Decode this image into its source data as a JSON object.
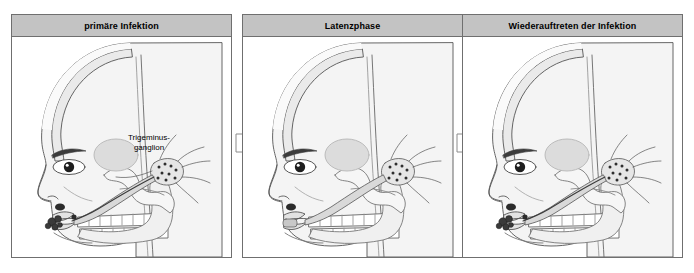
{
  "figure": {
    "background_color": "#ffffff",
    "header_fill": "#c3c3c3",
    "border_color": "#6f6f6f",
    "skin_fill": "#f2f2f2",
    "nerve_fill": "#d8d8d8",
    "lesion_color": "#3a3a3a",
    "line_color": "#4a4a4a"
  },
  "panels": [
    {
      "id": "panel-1",
      "title": "primäre Infektion",
      "label_line_1": "Trigeminus-",
      "label_line_2": "ganglion",
      "has_lip_lesions": true,
      "has_ganglion_virus": true
    },
    {
      "id": "panel-2",
      "title": "Latenzphase",
      "has_lip_lesions": false,
      "has_ganglion_virus": true
    },
    {
      "id": "panel-3",
      "title": "Wiederauftreten der Infektion",
      "has_lip_lesions": true,
      "has_ganglion_virus": true
    }
  ],
  "arrows": [
    {
      "id": "arrow-1",
      "direction": "right"
    },
    {
      "id": "arrow-2",
      "direction": "right"
    }
  ]
}
